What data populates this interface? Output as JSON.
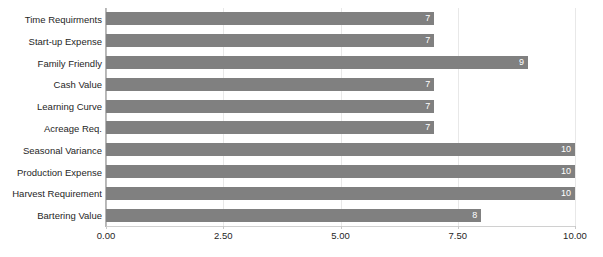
{
  "chart_data": {
    "type": "bar",
    "orientation": "horizontal",
    "title": "",
    "subtitle": "",
    "xlabel": "",
    "ylabel": "",
    "categories": [
      "Time Requirments",
      "Start-up Expense",
      "Family Friendly",
      "Cash Value",
      "Learning Curve",
      "Acreage Req.",
      "Seasonal Variance",
      "Production Expense",
      "Harvest Requirement",
      "Bartering Value"
    ],
    "values": [
      7,
      7,
      9,
      7,
      7,
      7,
      10,
      10,
      10,
      8
    ],
    "value_labels": [
      "7",
      "7",
      "9",
      "7",
      "7",
      "7",
      "10",
      "10",
      "10",
      "8"
    ],
    "xlim": [
      0,
      10
    ],
    "xticks": [
      0,
      2.5,
      5,
      7.5,
      10
    ],
    "xtick_labels": [
      "0.00",
      "2.50",
      "5.00",
      "7.50",
      "10.00"
    ],
    "grid": true,
    "grid_axis": "x",
    "legend": null,
    "legend_position": "none",
    "colors": {
      "bar": "#808080",
      "bar_label_text": "#ffffff",
      "background": "#ffffff",
      "gridline": "#e8e8e8",
      "axis_line": "#b5b5b5",
      "tick_text": "#262626",
      "category_text": "#262626"
    }
  }
}
